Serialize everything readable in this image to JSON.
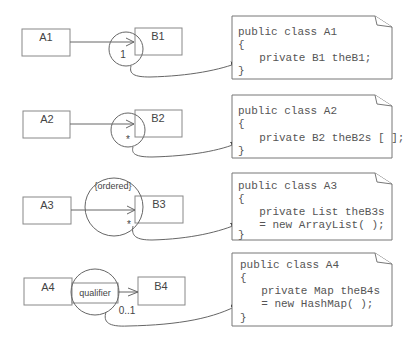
{
  "rows": [
    {
      "source_class": "A1",
      "target_class": "B1",
      "multiplicity": "1",
      "constraint": "",
      "qualifier": "",
      "code": [
        "public class A1",
        "{",
        "  private B1 theB1;",
        "}"
      ]
    },
    {
      "source_class": "A2",
      "target_class": "B2",
      "multiplicity": "*",
      "constraint": "",
      "qualifier": "",
      "code": [
        "public class A2",
        "{",
        "  private B2 theB2s [ ];",
        "}"
      ]
    },
    {
      "source_class": "A3",
      "target_class": "B3",
      "multiplicity": "*",
      "constraint": "{ordered}",
      "qualifier": "",
      "code": [
        "public class A3",
        "{",
        "  private List theB3s",
        "  = new ArrayList( );",
        "}"
      ]
    },
    {
      "source_class": "A4",
      "target_class": "B4",
      "multiplicity": "0..1",
      "constraint": "",
      "qualifier": "qualifier",
      "code": [
        "public class A4",
        "{",
        "  private Map theB4s",
        "  = new HashMap( );",
        "}"
      ]
    }
  ],
  "colors": {
    "stroke": "#777777",
    "text": "#444444",
    "background": "#ffffff"
  }
}
